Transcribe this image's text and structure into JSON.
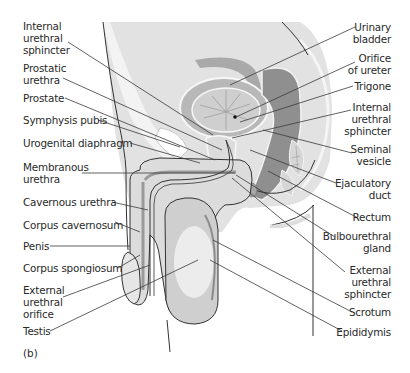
{
  "figure": {
    "caption": "(b)",
    "colors": {
      "background": "#ffffff",
      "body_fill": "#e0e0e0",
      "mid_grey": "#c4c4c4",
      "dark_grey": "#9a9a9a",
      "light_fill": "#efefef",
      "outline": "#333333",
      "leader_line": "#3a3a3a"
    },
    "left_labels": [
      {
        "id": "internal-urethral-sphincter-left",
        "text": "Internal\nurethral\nsphincter"
      },
      {
        "id": "prostatic-urethra",
        "text": "Prostatic\nurethra"
      },
      {
        "id": "prostate",
        "text": "Prostate"
      },
      {
        "id": "symphysis-pubis",
        "text": "Symphysis pubis"
      },
      {
        "id": "urogenital-diaphragm",
        "text": "Urogenital diaphragm"
      },
      {
        "id": "membranous-urethra",
        "text": "Membranous\nurethra"
      },
      {
        "id": "cavernous-urethra",
        "text": "Cavernous urethra"
      },
      {
        "id": "corpus-cavernosum",
        "text": "Corpus cavernosum"
      },
      {
        "id": "penis",
        "text": "Penis"
      },
      {
        "id": "corpus-spongiosum",
        "text": "Corpus spongiosum"
      },
      {
        "id": "external-urethral-orifice",
        "text": "External\nurethral\norifice"
      },
      {
        "id": "testis",
        "text": "Testis"
      }
    ],
    "right_labels": [
      {
        "id": "urinary-bladder",
        "text": "Urinary\nbladder"
      },
      {
        "id": "orifice-of-ureter",
        "text": "Orifice\nof ureter"
      },
      {
        "id": "trigone",
        "text": "Trigone"
      },
      {
        "id": "internal-urethral-sphincter-right",
        "text": "Internal\nurethral\nsphincter"
      },
      {
        "id": "seminal-vesicle",
        "text": "Seminal\nvesicle"
      },
      {
        "id": "ejaculatory-duct",
        "text": "Ejaculatory\nduct"
      },
      {
        "id": "rectum",
        "text": "Rectum"
      },
      {
        "id": "bulbourethral-gland",
        "text": "Bulbourethral\ngland"
      },
      {
        "id": "external-urethral-sphincter",
        "text": "External\nurethral\nsphincter"
      },
      {
        "id": "scrotum",
        "text": "Scrotum"
      },
      {
        "id": "epididymis",
        "text": "Epididymis"
      }
    ]
  }
}
